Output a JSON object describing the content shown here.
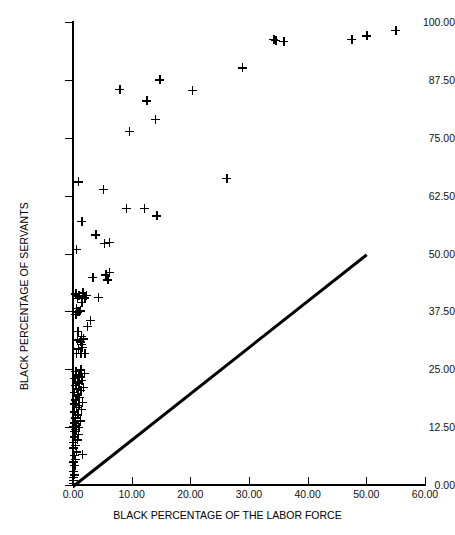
{
  "chart_data": {
    "type": "scatter",
    "title": "",
    "xlabel": "BLACK PERCENTAGE OF THE LABOR FORCE",
    "ylabel": "BLACK PERCENTAGE OF SERVANTS",
    "xlim": [
      0,
      60
    ],
    "ylim": [
      0,
      100
    ],
    "xticks": [
      0,
      10,
      20,
      30,
      40,
      50,
      60
    ],
    "xtick_labels": [
      "0.00",
      "10.00",
      "20.00",
      "30.00",
      "40.00",
      "50.00",
      "60.00"
    ],
    "yticks": [
      0,
      12.5,
      25,
      37.5,
      50,
      62.5,
      75,
      87.5,
      100
    ],
    "ytick_labels": [
      "0.00",
      "12.50",
      "25.00",
      "37.50",
      "50.00",
      "62.50",
      "75.00",
      "87.50",
      "100.00"
    ],
    "grid": false,
    "legend": false,
    "marker": "plus",
    "marker_color": "#000000",
    "reference_line": {
      "name": "parity-line",
      "label": "y = x",
      "x": [
        0,
        50
      ],
      "y": [
        0,
        50
      ],
      "color": "#000000",
      "width": 2.6
    },
    "points": [
      [
        0.0,
        0.4
      ],
      [
        0.1,
        1.0
      ],
      [
        0.0,
        1.6
      ],
      [
        0.2,
        2.2
      ],
      [
        0.1,
        3.0
      ],
      [
        0.3,
        4.2
      ],
      [
        0.0,
        5.0
      ],
      [
        0.4,
        5.6
      ],
      [
        0.2,
        6.4
      ],
      [
        1.6,
        6.6
      ],
      [
        0.6,
        7.2
      ],
      [
        0.1,
        8.0
      ],
      [
        0.4,
        8.6
      ],
      [
        0.0,
        9.2
      ],
      [
        0.7,
        9.8
      ],
      [
        0.3,
        10.4
      ],
      [
        0.9,
        11.0
      ],
      [
        0.2,
        11.6
      ],
      [
        0.5,
        12.0
      ],
      [
        1.0,
        12.4
      ],
      [
        0.1,
        12.6
      ],
      [
        0.6,
        12.9
      ],
      [
        0.3,
        13.4
      ],
      [
        1.2,
        13.9
      ],
      [
        0.4,
        14.5
      ],
      [
        0.8,
        15.2
      ],
      [
        0.2,
        15.8
      ],
      [
        1.4,
        16.4
      ],
      [
        0.6,
        16.8
      ],
      [
        1.0,
        17.2
      ],
      [
        0.3,
        17.5
      ],
      [
        1.6,
        17.9
      ],
      [
        0.5,
        18.4
      ],
      [
        1.1,
        18.9
      ],
      [
        0.8,
        19.5
      ],
      [
        0.2,
        20.0
      ],
      [
        1.3,
        20.4
      ],
      [
        0.6,
        20.8
      ],
      [
        1.8,
        21.1
      ],
      [
        0.4,
        21.5
      ],
      [
        1.0,
        21.9
      ],
      [
        0.7,
        22.3
      ],
      [
        1.5,
        22.6
      ],
      [
        0.3,
        23.0
      ],
      [
        1.1,
        23.4
      ],
      [
        0.9,
        23.8
      ],
      [
        1.9,
        24.1
      ],
      [
        0.5,
        24.5
      ],
      [
        1.3,
        24.9
      ],
      [
        0.6,
        28.4
      ],
      [
        1.3,
        28.4
      ],
      [
        2.0,
        28.4
      ],
      [
        0.9,
        29.4
      ],
      [
        1.6,
        29.8
      ],
      [
        1.5,
        30.4
      ],
      [
        1.2,
        30.9
      ],
      [
        0.7,
        31.4
      ],
      [
        1.8,
        31.6
      ],
      [
        1.4,
        32.1
      ],
      [
        0.8,
        33.2
      ],
      [
        2.4,
        34.3
      ],
      [
        2.9,
        35.6
      ],
      [
        0.5,
        36.9
      ],
      [
        0.8,
        37.4
      ],
      [
        1.0,
        37.5
      ],
      [
        1.2,
        37.6
      ],
      [
        0.6,
        38.2
      ],
      [
        1.5,
        39.5
      ],
      [
        0.7,
        40.3
      ],
      [
        2.0,
        40.4
      ],
      [
        4.3,
        40.5
      ],
      [
        1.0,
        40.9
      ],
      [
        2.3,
        41.0
      ],
      [
        0.5,
        41.3
      ],
      [
        1.7,
        41.5
      ],
      [
        5.6,
        45.4
      ],
      [
        6.2,
        46.0
      ],
      [
        5.9,
        44.3
      ],
      [
        3.4,
        44.8
      ],
      [
        5.3,
        52.2
      ],
      [
        6.2,
        52.4
      ],
      [
        0.6,
        50.9
      ],
      [
        3.9,
        54.0
      ],
      [
        1.5,
        57.0
      ],
      [
        9.1,
        59.8
      ],
      [
        12.2,
        59.7
      ],
      [
        14.3,
        58.1
      ],
      [
        0.9,
        65.5
      ],
      [
        5.2,
        63.8
      ],
      [
        26.2,
        66.2
      ],
      [
        9.6,
        76.4
      ],
      [
        14.0,
        79.0
      ],
      [
        12.6,
        83.0
      ],
      [
        8.0,
        85.4
      ],
      [
        20.3,
        85.2
      ],
      [
        14.8,
        87.5
      ],
      [
        28.9,
        90.1
      ],
      [
        34.2,
        96.3
      ],
      [
        34.6,
        96.0
      ],
      [
        35.9,
        95.8
      ],
      [
        47.5,
        96.2
      ],
      [
        50.1,
        97.0
      ],
      [
        55.0,
        98.2
      ]
    ]
  }
}
